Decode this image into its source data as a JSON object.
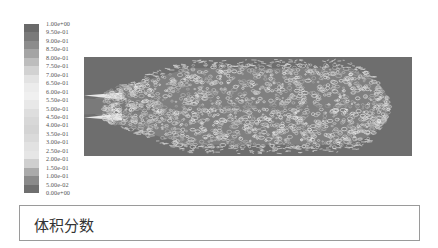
{
  "chart_data": {
    "type": "heatmap",
    "title": "体积分数",
    "colorbar": {
      "orientation": "vertical",
      "position": "left",
      "min": 0.0,
      "max": 1.0,
      "step": 0.05,
      "tick_labels": [
        "1.00e+00",
        "9.50e-01",
        "9.00e-01",
        "8.50e-01",
        "8.00e-01",
        "7.50e-01",
        "7.00e-01",
        "6.50e-01",
        "6.00e-01",
        "5.50e-01",
        "5.00e-01",
        "4.50e-01",
        "4.00e-01",
        "3.50e-01",
        "3.00e-01",
        "2.50e-01",
        "2.00e-01",
        "1.50e-01",
        "1.00e-01",
        "5.00e-02",
        "0.00e+00"
      ],
      "colors": [
        "#6a6a6a",
        "#7a7a7a",
        "#8c8c8c",
        "#a4a4a4",
        "#bdbdbd",
        "#d2d2d2",
        "#e3e3e3",
        "#ececec",
        "#f0f0f0",
        "#e8e8e8",
        "#dedede",
        "#d8d8d8",
        "#d4d4d4",
        "#dadada",
        "#e2e2e2",
        "#e6e6e6",
        "#cfcfcf",
        "#aaaaaa",
        "#8a8a8a",
        "#6f6f6f",
        "#5e5e5e"
      ]
    },
    "background_value_color": "#6e6e6e",
    "plume": {
      "inlet_side": "left",
      "tip_x_fraction": 0.93,
      "max_half_width_fraction": 0.42
    }
  },
  "caption": {
    "text": "体积分数"
  }
}
